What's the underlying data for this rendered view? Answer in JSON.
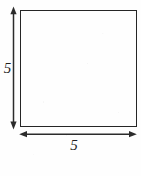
{
  "figure": {
    "kind": "geometry-diagram",
    "canvas": {
      "width": 141,
      "height": 176,
      "background_color": "#fefefe"
    },
    "shape": {
      "name": "square",
      "stroke_color": "#262626",
      "stroke_width": 1.4,
      "fill": "none",
      "left": 20,
      "top": 10,
      "size": 117
    },
    "dimensions": [
      {
        "id": "height",
        "orientation": "vertical",
        "label": "5",
        "arrow_style": "double-headed",
        "position": "left",
        "stroke_color": "#2b2b2b"
      },
      {
        "id": "width",
        "orientation": "horizontal",
        "label": "5",
        "arrow_style": "double-headed",
        "position": "bottom",
        "stroke_color": "#2b2b2b"
      }
    ]
  }
}
